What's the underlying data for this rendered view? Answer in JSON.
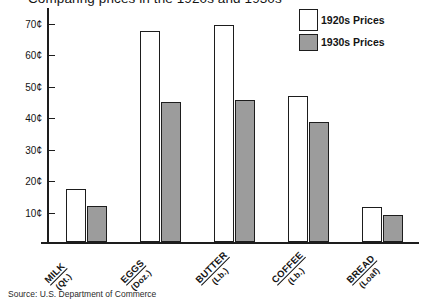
{
  "chart_data": {
    "type": "bar",
    "title": "Comparing prices in the 1920s and 1930s",
    "xlabel": "",
    "ylabel": "",
    "ylim": [
      0,
      75
    ],
    "grid": false,
    "legend_position": "top-right",
    "categories": [
      "MILK",
      "EGGS",
      "BUTTER",
      "COFFEE",
      "BREAD"
    ],
    "category_units": [
      "(Qt.)",
      "(Doz.)",
      "(Lb.)",
      "(Lb.)",
      "(Loaf)"
    ],
    "ytick_labels": [
      "70¢",
      "60¢",
      "50¢",
      "40¢",
      "30¢",
      "20¢",
      "10¢"
    ],
    "ytick_values": [
      70,
      60,
      50,
      40,
      30,
      20,
      10
    ],
    "series": [
      {
        "name": "1920s Prices",
        "color": "#ffffff",
        "values": [
          17,
          67,
          69,
          46.5,
          11
        ]
      },
      {
        "name": "1930s Prices",
        "color": "#9c9c9c",
        "values": [
          11.5,
          44.5,
          45,
          38,
          8.5
        ]
      }
    ],
    "source": "Source: U.S. Department of Commerce"
  },
  "legend": {
    "items": [
      {
        "label": "1920s Prices"
      },
      {
        "label": "1930s Prices"
      }
    ]
  }
}
